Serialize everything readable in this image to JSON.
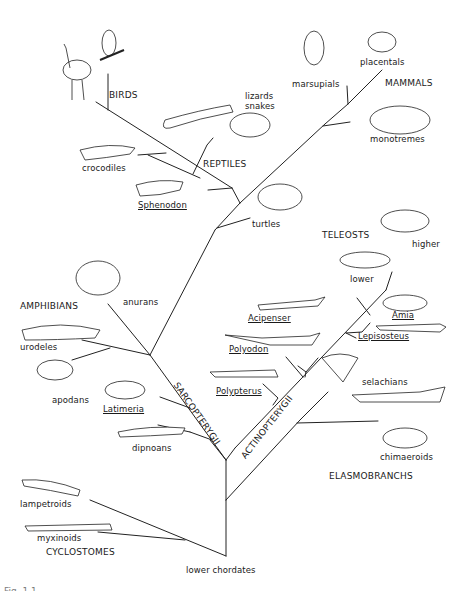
{
  "diagram": {
    "type": "phylogenetic-tree",
    "root": "lower chordates",
    "groups": {
      "birds": "BIRDS",
      "mammals": "MAMMALS",
      "reptiles": "REPTILES",
      "teleosts": "TELEOSTS",
      "amphibians": "AMPHIBIANS",
      "sarcopterygii": "SARCOPTERYGII",
      "actinopterygii": "ACTINOPTERYGII",
      "elasmobranchs": "ELASMOBRANCHS",
      "cyclostomes": "CYCLOSTOMES"
    },
    "taxa": {
      "marsupials": "marsupials",
      "placentals": "placentals",
      "monotremes": "monotremes",
      "lizards_snakes_1": "lizards",
      "lizards_snakes_2": "snakes",
      "crocodiles": "crocodiles",
      "sphenodon": "Sphenodon",
      "turtles": "turtles",
      "higher": "higher",
      "lower": "lower",
      "anurans": "anurans",
      "urodeles": "urodeles",
      "apodans": "apodans",
      "acipenser": "Acipenser",
      "polyodon": "Polyodon",
      "amia": "Amia",
      "lepisosteus": "Lepisosteus",
      "polypterus": "Polypterus",
      "latimeria": "Latimeria",
      "dipnoans": "dipnoans",
      "selachians": "selachians",
      "chimaeroids": "chimaeroids",
      "lampetroids": "lampetroids",
      "myxinoids": "myxinoids"
    },
    "root_label": "lower chordates",
    "caption_fragment": "Fig. 1.1 ..."
  },
  "colors": {
    "line": "#222222",
    "background": "#ffffff",
    "text": "#1a1a1a"
  }
}
